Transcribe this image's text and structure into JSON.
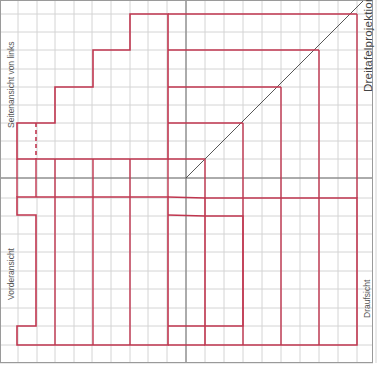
{
  "labels": {
    "side_view": "Seitenansicht von links",
    "front_view": "Vorderansicht",
    "top_view": "Draufsicht",
    "title": "Dreitafelprojektion"
  },
  "colors": {
    "grid": "#d4d4d4",
    "axis": "#6f6f6f",
    "outline": "#c0364f",
    "diagonal": "#444444",
    "label": "#555555"
  },
  "grid": {
    "x_lines": [
      0,
      18,
      37,
      55,
      74,
      92,
      111,
      130,
      148,
      167,
      186,
      205,
      224,
      243,
      262,
      281,
      300,
      319,
      338,
      357,
      376
    ],
    "y_lines": [
      14,
      32,
      50,
      69,
      87,
      105,
      123,
      141,
      159,
      178,
      198,
      216,
      234,
      252,
      271,
      289,
      308,
      326,
      345,
      363
    ],
    "axis_x": 186,
    "axis_y": 178
  },
  "side_view_outline": [
    [
      17,
      159
    ],
    [
      17,
      123
    ],
    [
      55,
      123
    ],
    [
      55,
      87
    ],
    [
      93,
      87
    ],
    [
      93,
      50
    ],
    [
      130,
      50
    ],
    [
      130,
      14
    ],
    [
      168,
      14
    ],
    [
      168,
      159
    ]
  ],
  "side_view_inner": {
    "dashed_x": 36,
    "dashed_y": [
      123,
      159
    ],
    "verticals_below": [
      36,
      55,
      93,
      130
    ]
  },
  "front_view_outline": [
    [
      17,
      197
    ],
    [
      168,
      197
    ],
    [
      168,
      345
    ],
    [
      17,
      345
    ],
    [
      17,
      326
    ],
    [
      36,
      326
    ],
    [
      36,
      215
    ],
    [
      17,
      215
    ]
  ],
  "front_view_verticals": [
    55,
    93,
    130
  ],
  "top_view_outline": [
    [
      205,
      198
    ],
    [
      357,
      198
    ],
    [
      357,
      345
    ],
    [
      205,
      345
    ]
  ],
  "top_view_verticals": [
    243,
    281,
    319
  ],
  "top_view_inner_box": [
    [
      205,
      216
    ],
    [
      243,
      216
    ],
    [
      243,
      326
    ],
    [
      205,
      326
    ]
  ],
  "projection_lines": {
    "horizontal_y": [
      14,
      50,
      87,
      123,
      159
    ],
    "diagonal_hits_x": [
      357,
      319,
      281,
      243,
      205
    ]
  }
}
